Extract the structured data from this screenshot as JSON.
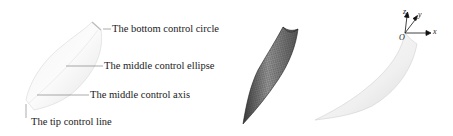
{
  "panel_a": {
    "labels": {
      "bottom_circle": "The bottom control circle",
      "middle_ellipse": "The middle control ellipse",
      "middle_axis": "The middle control axis",
      "tip_line": "The tip control line"
    }
  },
  "panel_b": {
    "description": "wireframe mesh surface"
  },
  "panel_c": {
    "axes": {
      "x": "x",
      "y": "y",
      "z": "z",
      "origin": "O"
    }
  }
}
